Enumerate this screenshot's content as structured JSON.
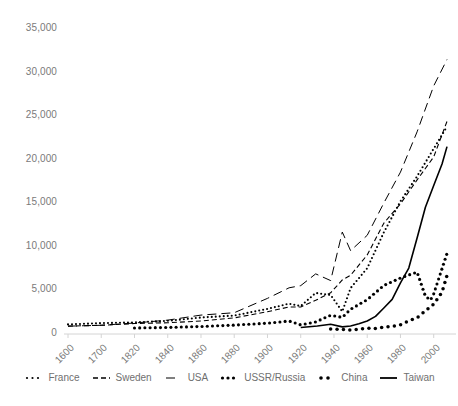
{
  "chart_data": {
    "type": "line",
    "title": "",
    "subtitle": "",
    "xlabel": "",
    "ylabel": "",
    "grid": false,
    "legend_position": "bottom",
    "x_tick_labels": [
      "1600",
      "1700",
      "1820",
      "1840",
      "1860",
      "1880",
      "1900",
      "1920",
      "1940",
      "1960",
      "1980",
      "2000"
    ],
    "y_tick_labels": [
      "0",
      "5,000",
      "10,000",
      "15,000",
      "20,000",
      "25,000",
      "30,000",
      "35,000"
    ],
    "y_tick_values": [
      0,
      5000,
      10000,
      15000,
      20000,
      25000,
      30000,
      35000
    ],
    "ylim": [
      0,
      35000
    ],
    "xlim": [
      1600,
      2010
    ],
    "series": [
      {
        "name": "France",
        "style": "dotted",
        "color": "#000000",
        "x": [
          1600,
          1700,
          1820,
          1840,
          1860,
          1880,
          1900,
          1913,
          1920,
          1929,
          1938,
          1945,
          1950,
          1960,
          1970,
          1980,
          1990,
          2000,
          2008
        ],
        "values": [
          1100,
          1250,
          1330,
          1510,
          1890,
          2120,
          2880,
          3480,
          3200,
          4710,
          4470,
          2570,
          5270,
          7550,
          11660,
          15230,
          18090,
          21270,
          23800
        ]
      },
      {
        "name": "Sweden",
        "style": "dashed",
        "color": "#000000",
        "x": [
          1600,
          1700,
          1820,
          1840,
          1860,
          1880,
          1900,
          1913,
          1920,
          1929,
          1938,
          1945,
          1950,
          1960,
          1970,
          1980,
          1990,
          2000,
          2008
        ],
        "values": [
          900,
          1000,
          1200,
          1290,
          1490,
          1850,
          2560,
          3100,
          3100,
          3870,
          4730,
          6200,
          6740,
          9070,
          12720,
          14940,
          17680,
          20320,
          24400
        ]
      },
      {
        "name": "USA",
        "style": "longdash",
        "color": "#000000",
        "x": [
          1600,
          1700,
          1820,
          1840,
          1860,
          1880,
          1900,
          1913,
          1920,
          1929,
          1938,
          1945,
          1950,
          1960,
          1970,
          1980,
          1990,
          2000,
          2008
        ],
        "values": [
          900,
          1000,
          1260,
          1590,
          2170,
          2440,
          4090,
          5300,
          5550,
          6900,
          6130,
          11700,
          9560,
          11330,
          15030,
          18580,
          23200,
          28470,
          31500
        ]
      },
      {
        "name": "USSR/Russia",
        "style": "dotted-bold",
        "color": "#000000",
        "x": [
          1820,
          1840,
          1860,
          1880,
          1900,
          1913,
          1920,
          1929,
          1938,
          1945,
          1950,
          1960,
          1970,
          1980,
          1990,
          1995,
          1998,
          2000,
          2008
        ],
        "values": [
          690,
          750,
          860,
          1020,
          1240,
          1490,
          1050,
          1390,
          2150,
          1910,
          2840,
          3940,
          5570,
          6430,
          7110,
          4340,
          3890,
          4600,
          9250
        ]
      },
      {
        "name": "China",
        "style": "dotted-large",
        "color": "#000000",
        "x": [
          1938,
          1945,
          1950,
          1955,
          1960,
          1965,
          1970,
          1975,
          1980,
          1985,
          1990,
          1995,
          2000,
          2005,
          2008
        ],
        "values": [
          560,
          520,
          450,
          560,
          660,
          640,
          780,
          870,
          1060,
          1520,
          1860,
          2650,
          3420,
          4800,
          6730
        ]
      },
      {
        "name": "Taiwan",
        "style": "solid",
        "color": "#000000",
        "x": [
          1920,
          1930,
          1938,
          1945,
          1950,
          1955,
          1960,
          1965,
          1970,
          1975,
          1980,
          1985,
          1990,
          1995,
          2000,
          2005,
          2008
        ],
        "values": [
          750,
          920,
          1110,
          820,
          920,
          1180,
          1490,
          2020,
          2980,
          3970,
          5870,
          7570,
          11020,
          14540,
          17050,
          19500,
          21500
        ]
      }
    ],
    "legend_entries": [
      {
        "label": "France",
        "style": "dotted"
      },
      {
        "label": "Sweden",
        "style": "dashed"
      },
      {
        "label": "USA",
        "style": "longdash"
      },
      {
        "label": "USSR/Russia",
        "style": "dotted-bold"
      },
      {
        "label": "China",
        "style": "dotted-large"
      },
      {
        "label": "Taiwan",
        "style": "solid"
      }
    ]
  },
  "axes": {
    "plot_left": 68,
    "plot_right": 452,
    "plot_top": 29,
    "plot_bottom": 334
  }
}
